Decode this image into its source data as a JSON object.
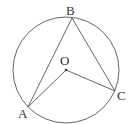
{
  "diagram": {
    "type": "circle-inscribed-angle",
    "stroke_color": "#555555",
    "circle": {
      "cx": 66,
      "cy": 70,
      "r": 53
    },
    "points": {
      "A": {
        "x": 28,
        "y": 107,
        "label": "A"
      },
      "B": {
        "x": 72,
        "y": 18,
        "label": "B"
      },
      "C": {
        "x": 115,
        "y": 91,
        "label": "C"
      },
      "O": {
        "x": 66,
        "y": 70,
        "label": "O"
      }
    },
    "segments": [
      [
        "A",
        "B"
      ],
      [
        "B",
        "C"
      ],
      [
        "A",
        "O"
      ],
      [
        "O",
        "C"
      ]
    ]
  }
}
